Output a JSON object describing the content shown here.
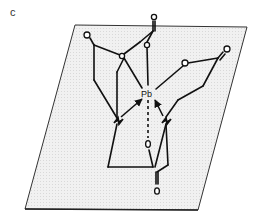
{
  "figure": {
    "panel_label": "c",
    "metal_label": "Pb",
    "colors": {
      "plane_fill": "#efefef",
      "plane_stroke": "#333333",
      "bond": "#111111",
      "background": "#ffffff"
    },
    "atoms": {
      "metal": "Pb",
      "nitrogens": [
        "N",
        "N"
      ],
      "oxygen_symbol": "O"
    }
  }
}
